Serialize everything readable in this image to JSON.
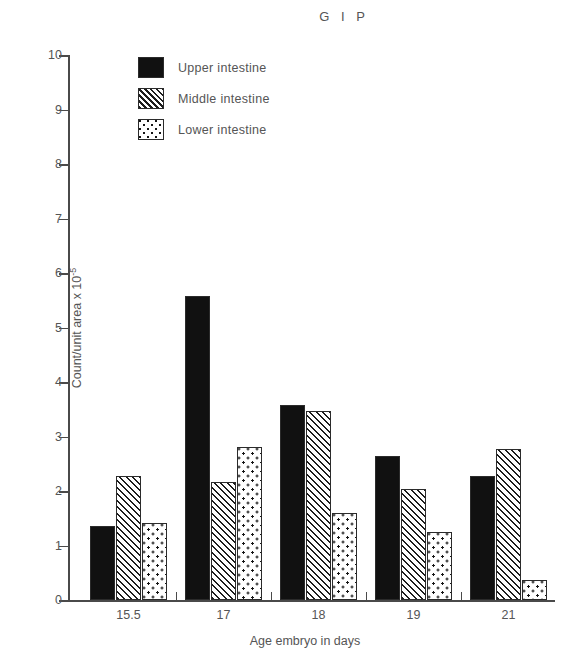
{
  "chart_data": {
    "type": "bar",
    "title": "G I P",
    "xlabel": "Age embryo in days",
    "ylabel": "Count/unit area x 10",
    "ylabel_exponent": "-5",
    "categories": [
      "15.5",
      "17",
      "18",
      "19",
      "21"
    ],
    "series": [
      {
        "name": "Upper intestine",
        "pattern": "solid",
        "values": [
          1.35,
          5.58,
          3.58,
          2.65,
          2.27
        ]
      },
      {
        "name": "Middle intestine",
        "pattern": "hatch",
        "values": [
          2.27,
          2.17,
          3.47,
          2.03,
          2.78
        ]
      },
      {
        "name": "Lower intestine",
        "pattern": "dotted",
        "values": [
          1.42,
          2.8,
          1.6,
          1.25,
          0.37
        ]
      }
    ],
    "ylim": [
      0,
      10
    ],
    "yticks": [
      "0",
      "1",
      "2",
      "3",
      "4",
      "5",
      "6",
      "7",
      "8",
      "9",
      "10"
    ],
    "grid": false,
    "legend_position": "top-left-inside",
    "colors": {
      "ink": "#2b2b2b",
      "text": "#555555",
      "background": "#ffffff"
    }
  }
}
